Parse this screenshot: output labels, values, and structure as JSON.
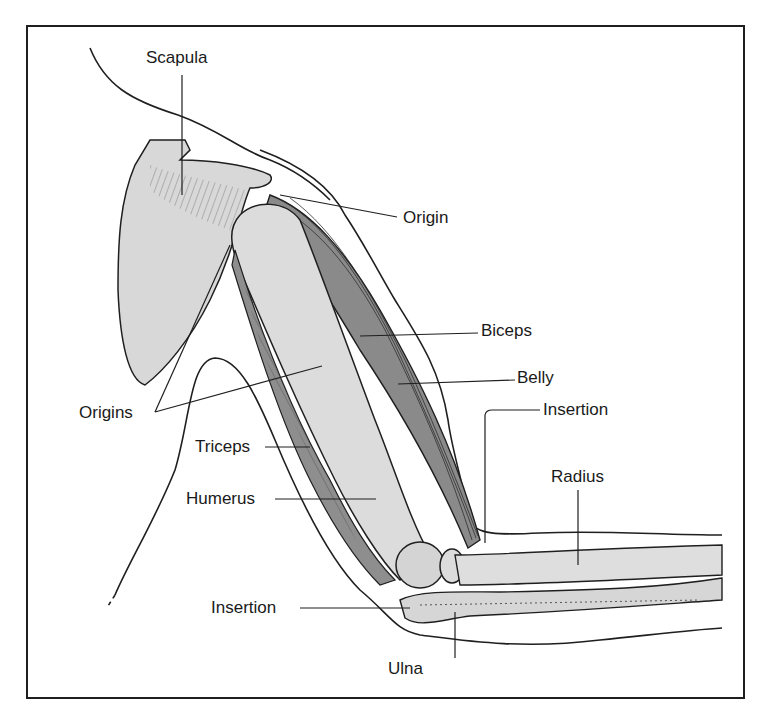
{
  "colors": {
    "outline": "#1f1f1f",
    "bone": "#d6d6d6",
    "bone_light": "#e4e4e4",
    "muscle": "#8c8c8c",
    "muscle_dark": "#6e6e6e",
    "background": "#ffffff"
  },
  "labels": {
    "scapula": "Scapula",
    "origin": "Origin",
    "biceps": "Biceps",
    "belly": "Belly",
    "insertion_biceps": "Insertion",
    "origins": "Origins",
    "triceps": "Triceps",
    "humerus": "Humerus",
    "radius": "Radius",
    "insertion_triceps": "Insertion",
    "ulna": "Ulna"
  }
}
